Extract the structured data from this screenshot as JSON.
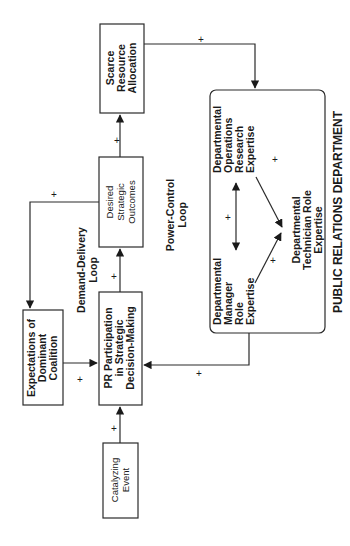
{
  "diagram": {
    "nodes": {
      "scarce_resource": [
        "Scarce",
        "Resource",
        "Allocation"
      ],
      "desired_outcomes": [
        "Desired",
        "Strategic",
        "Outcomes"
      ],
      "pr_participation": [
        "PR Participation",
        "in Strategic",
        "Decision-Making"
      ],
      "expectations": [
        "Expectations of",
        "Dominant",
        "Coalition"
      ],
      "catalyzing_event": [
        "Catalyzing",
        "Event"
      ],
      "dept_operations": [
        "Departmental",
        "Operations",
        "Research",
        "Expertise"
      ],
      "dept_manager": [
        "Departmental",
        "Manager",
        "Role",
        "Expertise"
      ],
      "dept_technician": [
        "Departmental",
        "Technician Role",
        "Expertise"
      ]
    },
    "loops": {
      "demand_delivery": [
        "Demand-Delivery",
        "Loop"
      ],
      "power_control": [
        "Power-Control",
        "Loop"
      ]
    },
    "department_label": "PUBLIC RELATIONS DEPARTMENT",
    "sign": "+"
  }
}
